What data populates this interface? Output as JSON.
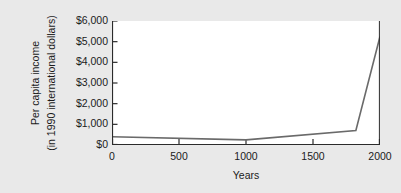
{
  "chart_data": {
    "type": "line",
    "title": "",
    "xlabel": "Years",
    "ylabel_line1": "Per capita income",
    "ylabel_line2": "(in 1990 international dollars)",
    "x": [
      0,
      1000,
      1820,
      2000
    ],
    "values": [
      400,
      250,
      700,
      5250
    ],
    "series": [
      {
        "name": "Per capita income",
        "x": [
          0,
          1000,
          1820,
          2000
        ],
        "values": [
          400,
          250,
          700,
          5250
        ],
        "color": "#6a6a6a"
      }
    ],
    "xlim": [
      0,
      2000
    ],
    "ylim": [
      0,
      6000
    ],
    "xticks": [
      0,
      500,
      1000,
      1500,
      2000
    ],
    "xtick_labels": [
      "0",
      "500",
      "1000",
      "1500",
      "2000"
    ],
    "yticks": [
      0,
      1000,
      2000,
      3000,
      4000,
      5000,
      6000
    ],
    "ytick_labels": [
      "$0",
      "$1,000",
      "$2,000",
      "$3,000",
      "$4,000",
      "$5,000",
      "$6,000"
    ],
    "grid": false,
    "legend": false,
    "legend_position": "none",
    "plot_background": "#ffffff",
    "figure_background": "#e9e9e9",
    "axis_color": "#2b2b2b",
    "text_color": "#1b1b1b"
  }
}
